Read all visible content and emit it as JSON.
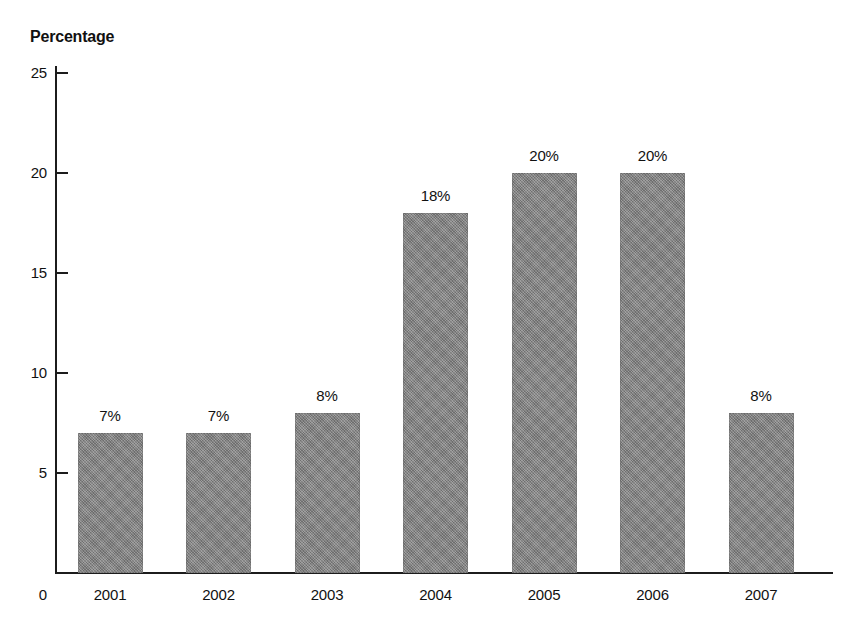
{
  "chart_data": {
    "type": "bar",
    "title": "Percentage",
    "xlabel": "",
    "ylabel": "Percentage",
    "categories": [
      "2001",
      "2002",
      "2003",
      "2004",
      "2005",
      "2006",
      "2007"
    ],
    "values": [
      7,
      7,
      8,
      18,
      20,
      20,
      8
    ],
    "data_labels": [
      "7%",
      "7%",
      "8%",
      "18%",
      "20%",
      "20%",
      "8%"
    ],
    "ylim": [
      0,
      25
    ],
    "y_ticks": [
      25,
      20,
      15,
      10,
      5
    ],
    "y_tick_labels": [
      "25",
      "20",
      "15",
      "10",
      "5"
    ],
    "y_origin_label": "0",
    "grid": false,
    "legend": false,
    "bar_color": "#838383",
    "axis_color": "#1c1c1c",
    "background": "#ffffff"
  }
}
